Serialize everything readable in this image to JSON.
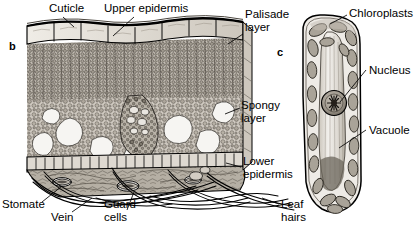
{
  "figure": {
    "panels": [
      {
        "id": "panel-b",
        "letter": "b",
        "x": 9,
        "y": 40
      },
      {
        "id": "panel-c",
        "letter": "c",
        "x": 277,
        "y": 46
      }
    ],
    "labels": [
      {
        "name": "cuticle",
        "text": "Cuticle",
        "x": 49,
        "y": 2,
        "align": "left"
      },
      {
        "name": "upper-epidermis",
        "text": "Upper epidermis",
        "x": 104,
        "y": 2,
        "align": "left"
      },
      {
        "name": "palisade-layer",
        "text": "Palisade\nlayer",
        "x": 245,
        "y": 8,
        "align": "left"
      },
      {
        "name": "spongy-layer",
        "text": "Spongy\nlayer",
        "x": 241,
        "y": 99,
        "align": "left"
      },
      {
        "name": "lower-epidermis",
        "text": "Lower\nepidermis",
        "x": 243,
        "y": 155,
        "align": "left"
      },
      {
        "name": "stomate",
        "text": "Stomate",
        "x": 2,
        "y": 198,
        "align": "left"
      },
      {
        "name": "vein",
        "text": "Vein",
        "x": 51,
        "y": 211,
        "align": "left"
      },
      {
        "name": "guard-cells",
        "text": "Guard\ncells",
        "x": 104,
        "y": 198,
        "align": "left"
      },
      {
        "name": "leaf-hairs",
        "text": "Leaf\nhairs",
        "x": 281,
        "y": 198,
        "align": "left"
      },
      {
        "name": "chloroplasts",
        "text": "Chloroplasts",
        "x": 349,
        "y": 7,
        "align": "left"
      },
      {
        "name": "nucleus",
        "text": "Nucleus",
        "x": 369,
        "y": 64,
        "align": "left"
      },
      {
        "name": "vacuole",
        "text": "Vacuole",
        "x": 369,
        "y": 124,
        "align": "left"
      }
    ],
    "colors": {
      "ink": "#1a1a1a",
      "line": "#000000",
      "tissue_light": "#d8d3cb",
      "tissue_mid": "#b3ada3",
      "tissue_dark": "#8c857a",
      "airspace": "#f4f2ee",
      "background": "#ffffff",
      "chloroplast": "#9c968c",
      "vacuole": "#e6e3dd"
    }
  }
}
